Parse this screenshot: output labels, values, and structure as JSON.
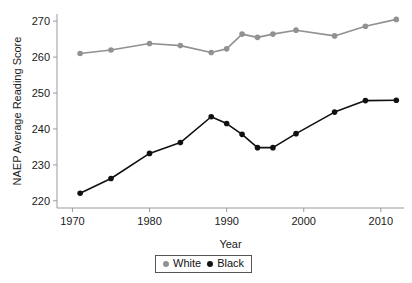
{
  "chart_data": {
    "type": "line",
    "title": "",
    "xlabel": "Year",
    "ylabel": "NAEP Average Reading Score",
    "xlim": [
      1968,
      2013
    ],
    "ylim": [
      218,
      272
    ],
    "xticks": [
      1970,
      1980,
      1990,
      2000,
      2010
    ],
    "xtick_labels": [
      "1970",
      "1980",
      "1990",
      "2000",
      "2010"
    ],
    "yticks": [
      220,
      230,
      240,
      250,
      260,
      270
    ],
    "ytick_labels": [
      "220",
      "230",
      "240",
      "250",
      "260",
      "270"
    ],
    "grid": false,
    "legend_position": "bottom-center",
    "series": [
      {
        "name": "White",
        "color": "#919191",
        "marker": "circle",
        "x": [
          1971,
          1975,
          1980,
          1984,
          1988,
          1990,
          1992,
          1994,
          1996,
          1999,
          2004,
          2008,
          2012
        ],
        "values": [
          261.0,
          262.0,
          263.8,
          263.2,
          261.3,
          262.3,
          266.4,
          265.5,
          266.4,
          267.5,
          265.9,
          268.6,
          270.5
        ]
      },
      {
        "name": "Black",
        "color": "#111111",
        "marker": "circle",
        "x": [
          1971,
          1975,
          1980,
          1984,
          1988,
          1990,
          1992,
          1994,
          1996,
          1999,
          2004,
          2008,
          2012
        ],
        "values": [
          222.1,
          226.2,
          233.2,
          236.2,
          243.4,
          241.5,
          238.5,
          234.8,
          234.8,
          238.7,
          244.7,
          247.9,
          248.0
        ]
      }
    ]
  },
  "legend": {
    "entries": [
      {
        "label": "White",
        "color": "#919191"
      },
      {
        "label": "Black",
        "color": "#111111"
      }
    ]
  }
}
